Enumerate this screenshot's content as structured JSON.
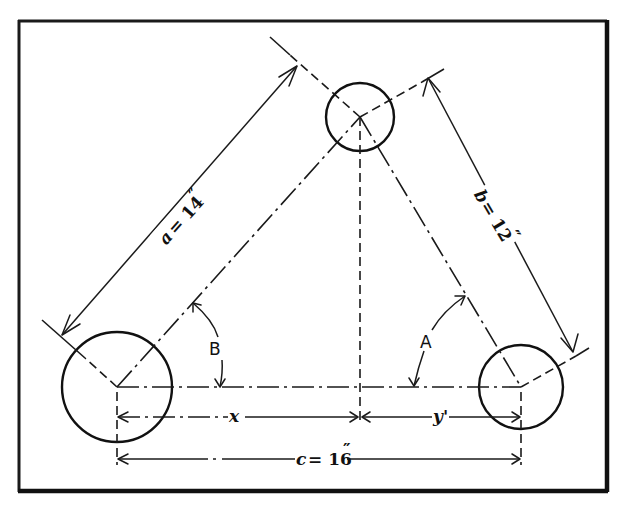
{
  "figure": {
    "type": "engineering-dimension-diagram"
  },
  "labels": {
    "side_a": "a = 14\"",
    "side_a_var": "a",
    "side_a_eq": "= 14",
    "side_b": "b = 12\"",
    "side_b_var": "b",
    "side_b_eq": "= 12",
    "side_c": "c = 16\"",
    "side_c_var": "c",
    "side_c_eq": "= 16",
    "inch_mark": "″",
    "angle_A": "A",
    "angle_B": "B",
    "segment_x": "x",
    "segment_y": "y'"
  },
  "geometry": {
    "frame": {
      "x": 18,
      "y": 20,
      "width": 590,
      "height": 472
    },
    "circles": [
      {
        "name": "left-circle",
        "cx": 117,
        "cy": 387,
        "r": 55
      },
      {
        "name": "top-circle",
        "cx": 360,
        "cy": 117,
        "r": 34
      },
      {
        "name": "right-circle",
        "cx": 521,
        "cy": 387,
        "r": 42
      }
    ],
    "dimensions": [
      {
        "name": "a",
        "value": 14,
        "unit": "in"
      },
      {
        "name": "b",
        "value": 12,
        "unit": "in"
      },
      {
        "name": "c",
        "value": 16,
        "unit": "in"
      }
    ]
  }
}
